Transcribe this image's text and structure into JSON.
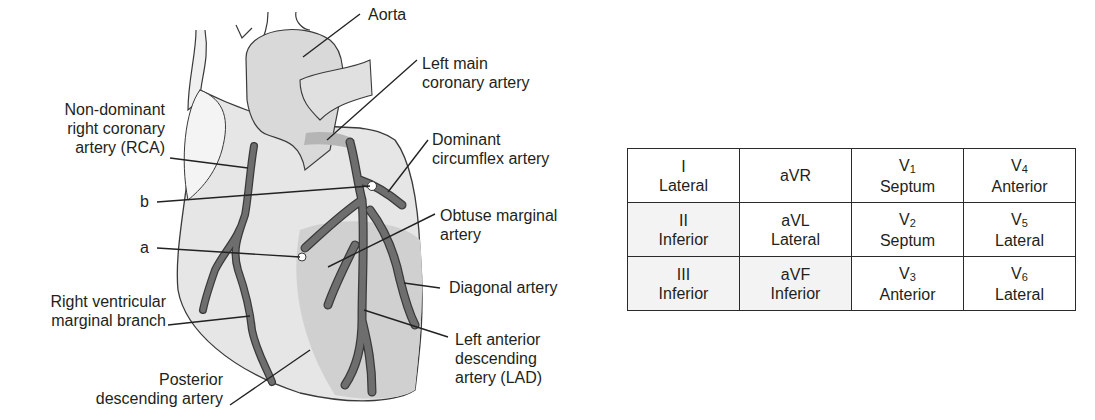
{
  "diagram": {
    "labels": {
      "aorta": "Aorta",
      "left_main": [
        "Left main",
        "coronary artery"
      ],
      "non_dominant_rca": [
        "Non-dominant",
        "right coronary",
        "artery (RCA)"
      ],
      "dominant_circumflex": [
        "Dominant",
        "circumflex artery"
      ],
      "b": "b",
      "obtuse_marginal": [
        "Obtuse marginal",
        "artery"
      ],
      "a": "a",
      "diagonal": "Diagonal artery",
      "rv_marginal": [
        "Right ventricular",
        "marginal branch"
      ],
      "lad": [
        "Left anterior",
        "descending",
        "artery (LAD)"
      ],
      "posterior_descending": [
        "Posterior",
        "descending artery"
      ]
    },
    "colors": {
      "outline": "#3a3a3a",
      "vessel": "#6e6e6e",
      "heart_fill": "#e6e6e6",
      "shadow": "#c8c8c8"
    }
  },
  "ecg_table": {
    "rows": [
      [
        {
          "lead": "I",
          "sub": "",
          "region": "Lateral"
        },
        {
          "lead": "aVR",
          "sub": "",
          "region": ""
        },
        {
          "lead": "V",
          "sub": "1",
          "region": "Septum"
        },
        {
          "lead": "V",
          "sub": "4",
          "region": "Anterior"
        }
      ],
      [
        {
          "lead": "II",
          "sub": "",
          "region": "Inferior"
        },
        {
          "lead": "aVL",
          "sub": "",
          "region": "Lateral"
        },
        {
          "lead": "V",
          "sub": "2",
          "region": "Septum"
        },
        {
          "lead": "V",
          "sub": "5",
          "region": "Lateral"
        }
      ],
      [
        {
          "lead": "III",
          "sub": "",
          "region": "Inferior"
        },
        {
          "lead": "aVF",
          "sub": "",
          "region": "Inferior"
        },
        {
          "lead": "V",
          "sub": "3",
          "region": "Anterior"
        },
        {
          "lead": "V",
          "sub": "6",
          "region": "Lateral"
        }
      ]
    ]
  }
}
